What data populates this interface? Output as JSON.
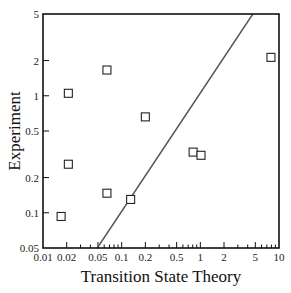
{
  "chart_data": {
    "type": "scatter",
    "title": "",
    "xlabel": "Transition State Theory",
    "ylabel": "Experiment",
    "xscale": "log",
    "yscale": "log",
    "xlim": [
      0.01,
      10
    ],
    "ylim": [
      0.05,
      5
    ],
    "x_ticks": [
      0.01,
      0.02,
      0.05,
      0.1,
      0.2,
      0.5,
      1,
      2,
      5,
      10
    ],
    "x_tick_labels": [
      "0.01",
      "0.02",
      "0.05",
      "0.1",
      "0.2",
      "0.5",
      "1",
      "2",
      "5",
      "10"
    ],
    "y_ticks": [
      0.05,
      0.1,
      0.2,
      0.5,
      1,
      2,
      5
    ],
    "y_tick_labels": [
      "0.05",
      "0.1",
      "0.2",
      "0.5",
      "1",
      "2",
      "5"
    ],
    "grid": false,
    "legend": null,
    "marker": "open-square",
    "series": [
      {
        "name": "data",
        "points": [
          {
            "x": 0.017,
            "y": 0.093
          },
          {
            "x": 0.021,
            "y": 1.05
          },
          {
            "x": 0.021,
            "y": 0.26
          },
          {
            "x": 0.065,
            "y": 1.66
          },
          {
            "x": 0.065,
            "y": 0.147
          },
          {
            "x": 0.13,
            "y": 0.13
          },
          {
            "x": 0.2,
            "y": 0.66
          },
          {
            "x": 0.81,
            "y": 0.33
          },
          {
            "x": 1.02,
            "y": 0.31
          },
          {
            "x": 7.9,
            "y": 2.13
          }
        ]
      }
    ],
    "reference_line": {
      "name": "parity (y = x)",
      "from": [
        0.049,
        0.05
      ],
      "to": [
        4.65,
        5
      ]
    },
    "colors": {
      "axis": "#111111",
      "marker": "#222222",
      "line": "#555555"
    }
  }
}
